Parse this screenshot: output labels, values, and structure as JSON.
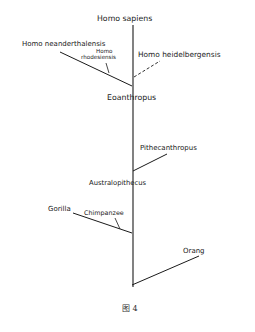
{
  "diagram": {
    "type": "phylogenetic-tree",
    "nodes": {
      "homo_sapiens": "Homo sapiens",
      "homo_neanderthalensis": "Homo neanderthalensis",
      "homo_rhodesiensis_1": "Homo",
      "homo_rhodesiensis_2": "rhodesiensis",
      "homo_heidelbergensis": "Homo heidelbergensis",
      "eoanthropus": "Eoanthropus",
      "pithecanthropus": "Pithecanthropus",
      "australopithecus": "Australopithecus",
      "gorilla": "Gorilla",
      "chimpanzee": "Chimpanzee",
      "orang": "Orang"
    },
    "caption": "图 4",
    "line_color": "#1a1a1a"
  }
}
